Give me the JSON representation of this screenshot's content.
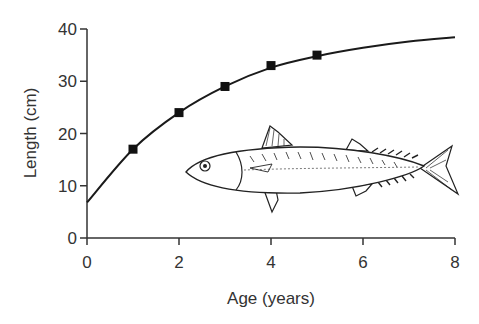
{
  "chart_data": {
    "type": "line",
    "title": "",
    "xlabel": "Age (years)",
    "ylabel": "Length (cm)",
    "xlim": [
      0,
      8
    ],
    "ylim": [
      0,
      40
    ],
    "x_ticks": [
      0,
      2,
      4,
      6,
      8
    ],
    "y_ticks": [
      0,
      10,
      20,
      30,
      40
    ],
    "grid": false,
    "legend": null,
    "series": [
      {
        "name": "Observed length",
        "kind": "scatter",
        "marker": "square",
        "x": [
          1,
          2,
          3,
          4,
          5
        ],
        "y": [
          17,
          24,
          29,
          33,
          35
        ]
      },
      {
        "name": "Growth curve",
        "kind": "line",
        "x": [
          0,
          1,
          2,
          3,
          4,
          5,
          6,
          7,
          8
        ],
        "y": [
          6.8,
          17,
          24,
          29,
          32.6,
          34.8,
          36.4,
          37.6,
          38.4
        ]
      }
    ],
    "annotations": [
      {
        "type": "illustration",
        "description": "fish (mackerel) drawing",
        "position": "lower right of plot"
      }
    ]
  },
  "colors": {
    "line": "#1a1a1a",
    "axis": "#333333",
    "text": "#333333"
  }
}
